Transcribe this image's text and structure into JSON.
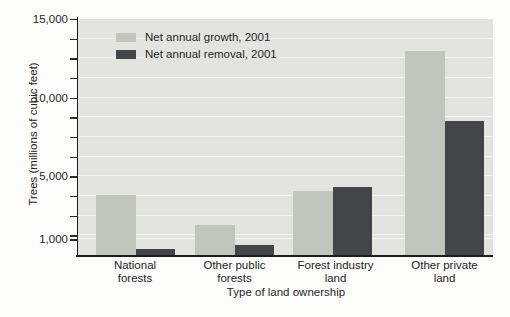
{
  "chart_data": {
    "type": "bar",
    "title": "",
    "categories": [
      "National forests",
      "Other public forests",
      "Forest industry land",
      "Other private land"
    ],
    "series": [
      {
        "name": "Net annual growth, 2001",
        "color": "#c2c4be",
        "values": [
          3800,
          1900,
          4100,
          13000
        ]
      },
      {
        "name": "Net annual removal, 2001",
        "color": "#424649",
        "values": [
          400,
          650,
          4300,
          8500
        ]
      }
    ],
    "xlabel": "Type of land ownership",
    "ylabel": "Trees (millions of cubic feet)",
    "ylim": [
      0,
      15000
    ],
    "yticks_labeled": [
      1000,
      5000,
      10000,
      15000
    ],
    "minor_tick_step": 1250,
    "extra_gridline_at": 1000,
    "grid": true,
    "legend_position": "top-left-inside"
  }
}
